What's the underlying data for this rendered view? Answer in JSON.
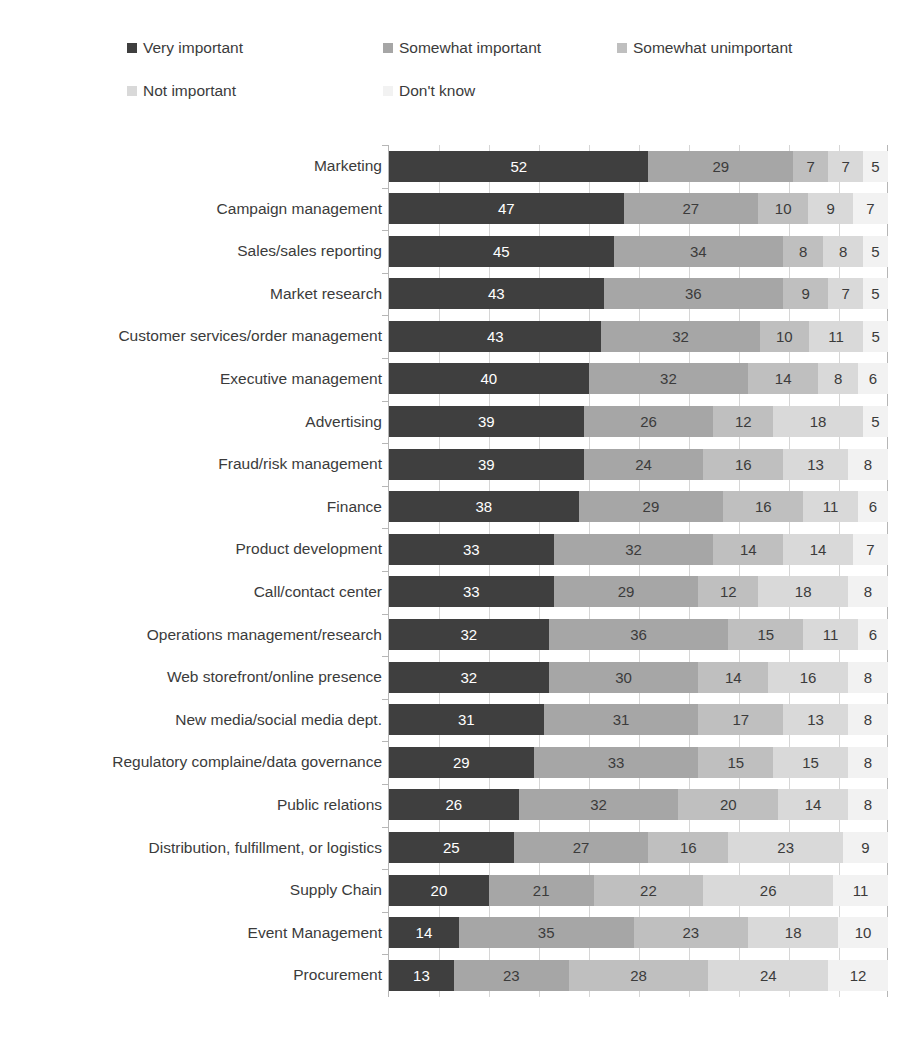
{
  "ghost": {
    "cropped_text": "..."
  },
  "legend": {
    "items": [
      {
        "label": "Very important",
        "color": "#3f3f3f"
      },
      {
        "label": "Somewhat important",
        "color": "#a6a6a6"
      },
      {
        "label": "Somewhat unimportant",
        "color": "#bfbfbf"
      },
      {
        "label": "Not important",
        "color": "#d9d9d9"
      },
      {
        "label": "Don't know",
        "color": "#f2f2f2"
      }
    ]
  },
  "chart_data": {
    "type": "bar",
    "title": "",
    "xlabel": "",
    "ylabel": "",
    "orientation": "horizontal",
    "stacked": true,
    "stack_mode": "percent",
    "xlim": [
      0,
      100
    ],
    "grid": true,
    "legend_position": "top",
    "series": [
      {
        "name": "Very important",
        "color": "#3f3f3f",
        "values": [
          52,
          47,
          45,
          43,
          43,
          40,
          39,
          39,
          38,
          33,
          33,
          32,
          32,
          31,
          29,
          26,
          25,
          20,
          14,
          13
        ]
      },
      {
        "name": "Somewhat important",
        "color": "#a6a6a6",
        "values": [
          29,
          27,
          34,
          36,
          32,
          32,
          26,
          24,
          29,
          32,
          29,
          36,
          30,
          31,
          33,
          32,
          27,
          21,
          35,
          23
        ]
      },
      {
        "name": "Somewhat unimportant",
        "color": "#bfbfbf",
        "values": [
          7,
          10,
          8,
          9,
          10,
          14,
          12,
          16,
          16,
          14,
          12,
          15,
          14,
          17,
          15,
          20,
          16,
          22,
          23,
          28
        ]
      },
      {
        "name": "Not important",
        "color": "#d9d9d9",
        "values": [
          7,
          9,
          8,
          7,
          11,
          8,
          18,
          13,
          11,
          14,
          18,
          11,
          16,
          13,
          15,
          14,
          23,
          26,
          18,
          24
        ]
      },
      {
        "name": "Don't know",
        "color": "#f2f2f2",
        "values": [
          5,
          7,
          5,
          5,
          5,
          6,
          5,
          8,
          6,
          7,
          8,
          6,
          8,
          8,
          8,
          8,
          9,
          11,
          10,
          12
        ]
      }
    ],
    "categories": [
      "Marketing",
      "Campaign management",
      "Sales/sales reporting",
      "Market research",
      "Customer services/order management",
      "Executive management",
      "Advertising",
      "Fraud/risk management",
      "Finance",
      "Product development",
      "Call/contact center",
      "Operations management/research",
      "Web storefront/online presence",
      "New media/social media dept.",
      "Regulatory complaine/data governance",
      "Public relations",
      "Distribution, fulfillment, or logistics",
      "Supply Chain",
      "Event Management",
      "Procurement"
    ],
    "rows": [
      {
        "category": "Marketing",
        "values": [
          52,
          29,
          7,
          7,
          5
        ]
      },
      {
        "category": "Campaign management",
        "values": [
          47,
          27,
          10,
          9,
          7
        ]
      },
      {
        "category": "Sales/sales reporting",
        "values": [
          45,
          34,
          8,
          8,
          5
        ]
      },
      {
        "category": "Market research",
        "values": [
          43,
          36,
          9,
          7,
          5
        ]
      },
      {
        "category": "Customer services/order management",
        "values": [
          43,
          32,
          10,
          11,
          5
        ]
      },
      {
        "category": "Executive management",
        "values": [
          40,
          32,
          14,
          8,
          6
        ]
      },
      {
        "category": "Advertising",
        "values": [
          39,
          26,
          12,
          18,
          5
        ]
      },
      {
        "category": "Fraud/risk management",
        "values": [
          39,
          24,
          16,
          13,
          8
        ]
      },
      {
        "category": "Finance",
        "values": [
          38,
          29,
          16,
          11,
          6
        ]
      },
      {
        "category": "Product development",
        "values": [
          33,
          32,
          14,
          14,
          7
        ]
      },
      {
        "category": "Call/contact center",
        "values": [
          33,
          29,
          12,
          18,
          8
        ]
      },
      {
        "category": "Operations management/research",
        "values": [
          32,
          36,
          15,
          11,
          6
        ]
      },
      {
        "category": "Web storefront/online presence",
        "values": [
          32,
          30,
          14,
          16,
          8
        ]
      },
      {
        "category": "New media/social media dept.",
        "values": [
          31,
          31,
          17,
          13,
          8
        ]
      },
      {
        "category": "Regulatory complaine/data governance",
        "values": [
          29,
          33,
          15,
          15,
          8
        ]
      },
      {
        "category": "Public relations",
        "values": [
          26,
          32,
          20,
          14,
          8
        ]
      },
      {
        "category": "Distribution, fulfillment, or logistics",
        "values": [
          25,
          27,
          16,
          23,
          9
        ]
      },
      {
        "category": "Supply Chain",
        "values": [
          20,
          21,
          22,
          26,
          11
        ]
      },
      {
        "category": "Event Management",
        "values": [
          14,
          35,
          23,
          18,
          10
        ]
      },
      {
        "category": "Procurement",
        "values": [
          13,
          23,
          28,
          24,
          12
        ]
      }
    ]
  }
}
